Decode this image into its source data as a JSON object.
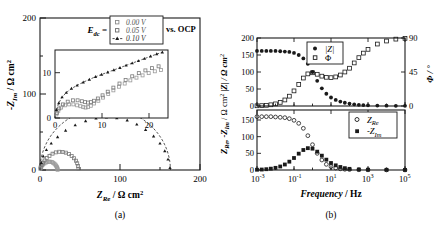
{
  "figure": {
    "panel_a_caption": "(a)",
    "panel_b_caption": "(b)"
  },
  "panel_a": {
    "xlabel_main": "Z",
    "xlabel_sub": "Re",
    "xlabel_unit": "/ Ω cm",
    "xlabel_exp": "2",
    "ylabel_main": "-Z",
    "ylabel_sub": "Im",
    "ylabel_unit": "/ Ω cm",
    "ylabel_exp": "2",
    "xticks": [
      "0",
      "100",
      "200"
    ],
    "yticks": [
      "0",
      "100",
      "200"
    ],
    "legend_title_main": "E",
    "legend_title_sub": "dc",
    "legend_title_eq": "=",
    "legend_suffix": "vs. OCP",
    "legend_items": [
      {
        "label": "0.00 V",
        "marker": "open-square",
        "color": "#8a8a8a"
      },
      {
        "label": "0.05 V",
        "marker": "open-square",
        "color": "#6a6a6a"
      },
      {
        "label": "0.10 V",
        "marker": "filled-triangle",
        "color": "#1a1a1a"
      }
    ],
    "inset": {
      "xticks": [
        "0",
        "10",
        "20"
      ],
      "yticks": [
        "0",
        "10"
      ]
    }
  },
  "panel_b": {
    "xlabel_main": "Frequency",
    "xlabel_unit": "/ Hz",
    "ylabel_left_1": "Z",
    "ylabel_left_1_sub": "Re",
    "ylabel_left_2": ", -Z",
    "ylabel_left_2_sub": "Im",
    "ylabel_left_3": "/ Ω cm",
    "ylabel_left_3_exp": "2",
    "ylabel_left_4": "|Z| / Ω cm",
    "ylabel_left_4_exp": "2",
    "ylabel_right": "Φ / °",
    "xticks": [
      {
        "mant": "10",
        "exp": "-3"
      },
      {
        "mant": "10",
        "exp": "-1"
      },
      {
        "mant": "10",
        "exp": "1"
      },
      {
        "mant": "10",
        "exp": "3"
      },
      {
        "mant": "10",
        "exp": "5"
      }
    ],
    "yticks_top": [
      "0",
      "50",
      "100",
      "150",
      "200"
    ],
    "yticks_bottom": [
      "0",
      "50",
      "100",
      "150"
    ],
    "yticks_right": [
      "0",
      "45",
      "90"
    ],
    "legend_top": [
      {
        "label": "|Z|",
        "marker": "filled-circle"
      },
      {
        "label": "Φ",
        "marker": "open-square"
      }
    ],
    "legend_bottom": [
      {
        "label": "Z",
        "sub": "Re",
        "marker": "open-circle"
      },
      {
        "label": "-Z",
        "sub": "Im",
        "marker": "filled-square"
      }
    ]
  },
  "chart_data": [
    {
      "type": "scatter",
      "id": "nyquist-main",
      "title": "",
      "xlabel": "Z_Re / Ω cm²",
      "ylabel": "-Z_Im / Ω cm²",
      "xlim": [
        0,
        200
      ],
      "ylim": [
        0,
        200
      ],
      "xticks": [
        0,
        100,
        200
      ],
      "yticks": [
        0,
        100,
        200
      ],
      "grid": false,
      "legend_position": "top-right",
      "series": [
        {
          "name": "0.00 V",
          "marker": "open-square",
          "semicircle_diameter": 22,
          "points_x": [
            0.4,
            0.9,
            1.6,
            2.6,
            3.9,
            5.5,
            7.3,
            9.2,
            11.0,
            12.9,
            14.7,
            16.3,
            17.8,
            19.1,
            20.1,
            20.9,
            21.5,
            21.9,
            22.0
          ],
          "points_y": [
            1.6,
            3.1,
            4.4,
            5.9,
            7.3,
            8.6,
            9.8,
            10.6,
            11.0,
            10.9,
            10.4,
            9.6,
            8.5,
            7.2,
            5.8,
            4.4,
            3.0,
            1.6,
            0.3
          ]
        },
        {
          "name": "0.05 V",
          "marker": "open-square",
          "semicircle_diameter": 48,
          "points_x": [
            0.8,
            2.0,
            3.6,
            5.7,
            8.4,
            11.8,
            15.7,
            19.8,
            24.0,
            28.2,
            32.3,
            36.2,
            39.6,
            42.6,
            45.0,
            46.5,
            47.5,
            48.0
          ],
          "points_y": [
            3.4,
            6.6,
            9.5,
            12.6,
            15.7,
            18.6,
            21.5,
            23.2,
            24.0,
            23.8,
            22.8,
            21.0,
            18.5,
            15.5,
            12.2,
            8.8,
            5.2,
            1.4
          ]
        },
        {
          "name": "0.10 V",
          "marker": "filled-triangle",
          "semicircle_diameter": 163,
          "points_x": [
            1.5,
            4.0,
            8.0,
            14.0,
            22.0,
            32.0,
            44.0,
            57.0,
            70.0,
            83.0,
            96.0,
            109.0,
            121.0,
            132.0,
            142.0,
            150.0,
            156.0,
            160.0,
            162.5
          ],
          "points_y": [
            9.5,
            18.0,
            26.5,
            35.0,
            43.5,
            52.0,
            59.0,
            64.5,
            68.0,
            69.5,
            68.5,
            65.5,
            60.0,
            53.0,
            44.5,
            35.0,
            25.0,
            14.0,
            3.0
          ]
        }
      ]
    },
    {
      "type": "scatter",
      "id": "nyquist-inset",
      "xlim": [
        0,
        24
      ],
      "ylim": [
        0,
        15
      ],
      "xticks": [
        0,
        10,
        20
      ],
      "yticks": [
        0,
        10
      ],
      "grid": false,
      "series": [
        {
          "name": "0.00 V",
          "marker": "open-square",
          "points_x": [
            0.3,
            0.7,
            1.3,
            2.1,
            3.0,
            3.9,
            4.7,
            5.4,
            6.0,
            6.5,
            7.0,
            7.6,
            8.3,
            9.2,
            10.2,
            11.3,
            12.4,
            13.6,
            14.8,
            16.0,
            17.3,
            18.6,
            19.9,
            21.2,
            22.5
          ],
          "points_y": [
            0.8,
            1.6,
            2.3,
            2.8,
            3.0,
            3.0,
            2.8,
            2.6,
            2.4,
            2.3,
            2.4,
            2.7,
            3.2,
            3.8,
            4.5,
            5.3,
            6.1,
            6.9,
            7.6,
            8.3,
            8.9,
            9.4,
            9.9,
            10.3,
            10.6
          ]
        },
        {
          "name": "0.05 V",
          "marker": "open-square",
          "points_x": [
            0.4,
            0.9,
            1.7,
            2.7,
            3.8,
            4.8,
            5.7,
            6.4,
            7.0,
            7.6,
            8.3,
            9.1,
            10.1,
            11.2,
            12.4,
            13.7,
            15.0,
            16.4,
            17.8,
            19.2,
            20.6,
            22.0
          ],
          "points_y": [
            1.1,
            2.1,
            3.0,
            3.6,
            3.9,
            3.9,
            3.7,
            3.5,
            3.4,
            3.5,
            3.8,
            4.3,
            5.0,
            5.8,
            6.7,
            7.6,
            8.4,
            9.2,
            9.9,
            10.5,
            11.0,
            11.4
          ]
        },
        {
          "name": "0.10 V",
          "marker": "filled-triangle",
          "points_x": [
            0.3,
            0.8,
            1.5,
            2.4,
            3.5,
            4.7,
            6.0,
            7.3,
            8.6,
            9.9,
            11.2,
            12.5,
            13.8,
            15.1,
            16.4,
            17.7,
            19.0,
            20.3,
            21.6,
            22.8
          ],
          "points_y": [
            1.8,
            3.3,
            4.6,
            5.6,
            6.5,
            7.2,
            7.9,
            8.5,
            9.1,
            9.6,
            10.1,
            10.6,
            11.1,
            11.6,
            12.1,
            12.6,
            13.1,
            13.6,
            14.1,
            14.5
          ]
        }
      ]
    },
    {
      "type": "scatter",
      "id": "bode-top",
      "xlabel": "Frequency / Hz",
      "ylabel": "|Z| / Ω cm²",
      "ylabel_right": "Φ / °",
      "xlim": [
        0.001,
        100000
      ],
      "xscale": "log",
      "ylim": [
        0,
        200
      ],
      "ylim_right": [
        0,
        90
      ],
      "grid": false,
      "legend_position": "top-center",
      "series": [
        {
          "name": "|Z|",
          "marker": "filled-circle",
          "axis": "left",
          "x": [
            0.001,
            0.0018,
            0.0032,
            0.0056,
            0.01,
            0.018,
            0.032,
            0.056,
            0.1,
            0.18,
            0.32,
            0.56,
            1.0,
            1.8,
            3.2,
            5.6,
            10,
            18,
            32,
            56,
            100,
            180,
            320,
            560,
            1000,
            3200,
            10000,
            32000,
            100000
          ],
          "y": [
            162,
            162,
            162,
            162,
            162,
            161,
            160,
            159,
            156,
            150,
            140,
            124,
            100,
            74,
            52,
            36,
            25,
            18,
            13,
            9.5,
            7,
            5,
            3.5,
            2.6,
            2,
            1.3,
            0.9,
            0.6,
            0.4
          ]
        },
        {
          "name": "Φ",
          "marker": "open-square",
          "axis": "right",
          "x": [
            0.001,
            0.0018,
            0.0032,
            0.0056,
            0.01,
            0.018,
            0.032,
            0.056,
            0.1,
            0.18,
            0.32,
            0.56,
            1.0,
            1.8,
            3.2,
            5.6,
            10,
            18,
            32,
            56,
            100,
            180,
            320,
            560,
            1000,
            3200,
            10000,
            32000,
            100000
          ],
          "y": [
            0.3,
            0.5,
            0.9,
            1.6,
            2.8,
            4.8,
            8.0,
            13.0,
            20.0,
            28.5,
            37.0,
            42.5,
            44.0,
            42.0,
            39.5,
            38.0,
            37.5,
            38.5,
            41.0,
            45.0,
            50.0,
            57.0,
            64.0,
            70.0,
            75.0,
            82.0,
            86.0,
            88.5,
            89.5
          ]
        }
      ]
    },
    {
      "type": "scatter",
      "id": "bode-bottom",
      "xlabel": "Frequency / Hz",
      "ylabel": "Z_Re, -Z_Im / Ω cm²",
      "xlim": [
        0.001,
        100000
      ],
      "xscale": "log",
      "ylim": [
        0,
        180
      ],
      "grid": false,
      "legend_position": "right",
      "series": [
        {
          "name": "Z_Re",
          "marker": "open-circle",
          "x": [
            0.001,
            0.0018,
            0.0032,
            0.0056,
            0.01,
            0.018,
            0.032,
            0.056,
            0.1,
            0.18,
            0.32,
            0.56,
            1.0,
            1.8,
            3.2,
            5.6,
            10,
            18,
            32,
            56,
            100,
            320,
            1000,
            10000,
            100000
          ],
          "y": [
            160,
            160,
            160,
            160,
            159,
            158,
            157,
            154,
            149,
            140,
            125,
            103,
            76,
            50,
            30,
            17,
            10,
            6,
            3.6,
            2.2,
            1.5,
            0.8,
            0.5,
            0.3,
            0.2
          ]
        },
        {
          "name": "-Z_Im",
          "marker": "filled-square",
          "x": [
            0.001,
            0.0018,
            0.0032,
            0.0056,
            0.01,
            0.018,
            0.032,
            0.056,
            0.1,
            0.18,
            0.32,
            0.56,
            1.0,
            1.8,
            3.2,
            5.6,
            10,
            18,
            32,
            56,
            100,
            320,
            1000,
            10000,
            100000
          ],
          "y": [
            0.8,
            1.4,
            2.4,
            4.0,
            6.5,
            10.5,
            16.5,
            25.0,
            36.0,
            49.0,
            60.0,
            65.5,
            64.0,
            55.0,
            43.0,
            31.0,
            21.0,
            14.0,
            9.0,
            5.5,
            3.5,
            1.6,
            0.9,
            0.4,
            0.2
          ]
        }
      ]
    }
  ]
}
